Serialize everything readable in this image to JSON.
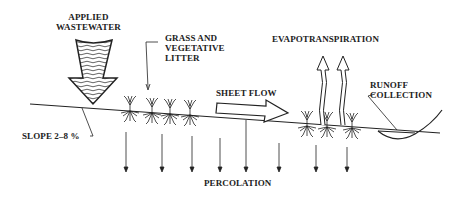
{
  "diagram": {
    "labels": {
      "applied_wastewater": "APPLIED\nWASTEWATER",
      "grass": "GRASS AND\nVEGETATIVE\nLITTER",
      "evapotranspiration": "EVAPOTRANSPIRATION",
      "runoff": "RUNOFF\nCOLLECTION",
      "sheet_flow": "SHEET FLOW",
      "slope": "SLOPE 2–8 %",
      "percolation": "PERCOLATION"
    },
    "colors": {
      "ink": "#222222",
      "background": "#ffffff"
    }
  }
}
